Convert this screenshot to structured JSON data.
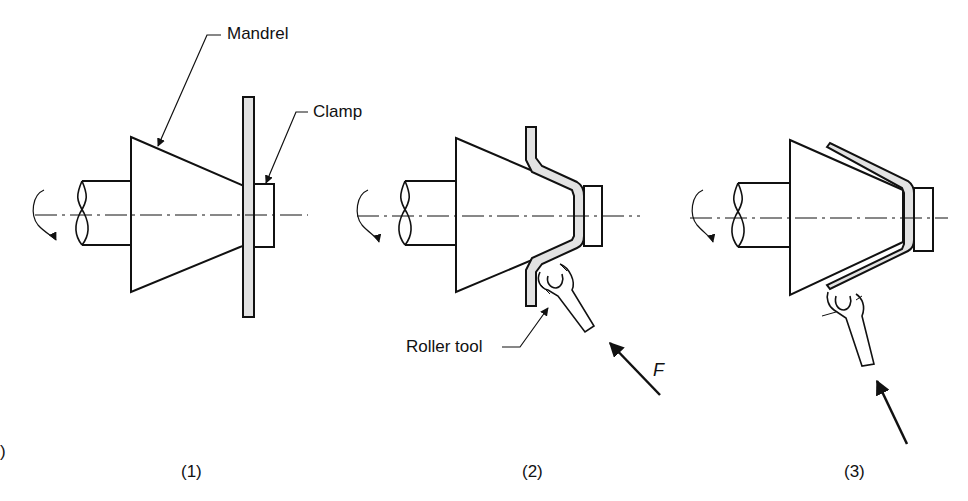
{
  "diagram": {
    "type": "process-stages",
    "colors": {
      "stroke": "#111111",
      "sheet_fill": "#e2e2e2",
      "background": "#ffffff"
    },
    "labels": {
      "mandrel": "Mandrel",
      "clamp": "Clamp",
      "roller_tool": "Roller tool",
      "force": "F"
    },
    "stages": [
      {
        "id": 1,
        "caption": "(1)"
      },
      {
        "id": 2,
        "caption": "(2)"
      },
      {
        "id": 3,
        "caption": "(3)"
      }
    ],
    "edge_mark": ")"
  }
}
